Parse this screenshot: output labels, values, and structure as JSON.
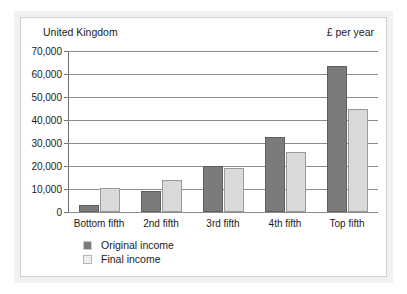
{
  "chart_data": {
    "type": "bar",
    "title": "",
    "region_label": "United Kingdom",
    "unit_label": "£ per year",
    "xlabel": "",
    "ylabel": "",
    "ylim": [
      0,
      70000
    ],
    "y_ticks": [
      0,
      10000,
      20000,
      30000,
      40000,
      50000,
      60000,
      70000
    ],
    "y_tick_labels": [
      "0",
      "10,000",
      "20,000",
      "30,000",
      "40,000",
      "50,000",
      "60,000",
      "70,000"
    ],
    "grid": true,
    "legend_position": "bottom-left",
    "categories": [
      "Bottom fifth",
      "2nd fifth",
      "3rd fifth",
      "4th fifth",
      "Top fifth"
    ],
    "series": [
      {
        "name": "Original income",
        "color": "#7b7b7b",
        "values": [
          3000,
          9000,
          20000,
          32500,
          63500
        ]
      },
      {
        "name": "Final income",
        "color": "#d9d9d9",
        "values": [
          10500,
          14000,
          19000,
          26000,
          45000
        ]
      }
    ]
  },
  "legend": {
    "items": [
      {
        "label": "Original income",
        "key": "original"
      },
      {
        "label": "Final income",
        "key": "final"
      }
    ]
  },
  "colors": {
    "original_income": "#7b7b7b",
    "final_income": "#d9d9d9",
    "axis": "#6f6f6f",
    "gridline": "#8d8d8d",
    "panel_background": "#ffffff",
    "frame_background": "#f2f2f2",
    "text": "#1b1b1b"
  }
}
